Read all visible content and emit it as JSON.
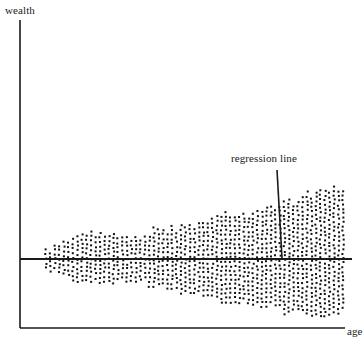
{
  "figure": {
    "background_color": "#ffffff",
    "ink_color": "#1a1a1a",
    "width": 364,
    "height": 345
  },
  "axes": {
    "y_axis_label": "wealth",
    "x_axis_label": "age",
    "y_axis_x": 20,
    "y_axis_top": 20,
    "y_axis_bottom": 328,
    "x_axis_y": 328,
    "x_axis_left": 20,
    "x_axis_right": 345,
    "zero_line_y": 259,
    "zero_line_left": 20,
    "zero_line_right": 352,
    "line_color": "#1a1a1a",
    "axis_line_width": 1.6,
    "zero_line_width": 1.8
  },
  "annotation": {
    "label": "regression line",
    "label_x": 231,
    "label_y": 152,
    "leader_x1": 277,
    "leader_y1": 170,
    "leader_x2": 282,
    "leader_y2": 258,
    "leader_width": 1.6,
    "color": "#1a1a1a"
  },
  "chart_data": {
    "type": "scatter",
    "title": "",
    "subtitle": "",
    "xlabel": "age",
    "ylabel": "wealth",
    "grid": false,
    "legend": null,
    "annotations": [
      {
        "text": "regression line",
        "describes": "horizontal line through the centre of the point cloud at wealth = 0 level",
        "points_to_x_px": 282,
        "points_to_y_px": 258
      }
    ],
    "xlim": [
      20,
      352
    ],
    "ylim": [
      328,
      20
    ],
    "regression_line": {
      "slope": 0,
      "intercept_px_y": 259,
      "x_start_px": 20,
      "x_end_px": 352
    },
    "cloud": {
      "x_start_px": 45,
      "x_end_px": 345,
      "center_y_px": 259,
      "dot_size_px": 2,
      "dot_pitch_px": 4.5,
      "jitter_px": 1.5,
      "approx_point_count": 2600,
      "envelope_note": "Half-height above and below the centre line, sampled left-to-right; irregular ragged boundary.",
      "upper_envelope": [
        {
          "x": 45,
          "half_height": 10
        },
        {
          "x": 60,
          "half_height": 17
        },
        {
          "x": 75,
          "half_height": 22
        },
        {
          "x": 90,
          "half_height": 25
        },
        {
          "x": 105,
          "half_height": 26
        },
        {
          "x": 120,
          "half_height": 24
        },
        {
          "x": 135,
          "half_height": 25
        },
        {
          "x": 150,
          "half_height": 28
        },
        {
          "x": 165,
          "half_height": 31
        },
        {
          "x": 180,
          "half_height": 33
        },
        {
          "x": 195,
          "half_height": 36
        },
        {
          "x": 210,
          "half_height": 40
        },
        {
          "x": 225,
          "half_height": 46
        },
        {
          "x": 240,
          "half_height": 44
        },
        {
          "x": 255,
          "half_height": 47
        },
        {
          "x": 270,
          "half_height": 54
        },
        {
          "x": 285,
          "half_height": 58
        },
        {
          "x": 300,
          "half_height": 62
        },
        {
          "x": 315,
          "half_height": 68
        },
        {
          "x": 330,
          "half_height": 72
        },
        {
          "x": 345,
          "half_height": 66
        }
      ],
      "lower_envelope": [
        {
          "x": 45,
          "half_height": 9
        },
        {
          "x": 60,
          "half_height": 16
        },
        {
          "x": 75,
          "half_height": 21
        },
        {
          "x": 90,
          "half_height": 24
        },
        {
          "x": 105,
          "half_height": 25
        },
        {
          "x": 120,
          "half_height": 22
        },
        {
          "x": 135,
          "half_height": 23
        },
        {
          "x": 150,
          "half_height": 26
        },
        {
          "x": 165,
          "half_height": 28
        },
        {
          "x": 180,
          "half_height": 31
        },
        {
          "x": 195,
          "half_height": 36
        },
        {
          "x": 210,
          "half_height": 40
        },
        {
          "x": 225,
          "half_height": 43
        },
        {
          "x": 240,
          "half_height": 45
        },
        {
          "x": 255,
          "half_height": 44
        },
        {
          "x": 270,
          "half_height": 48
        },
        {
          "x": 285,
          "half_height": 52
        },
        {
          "x": 300,
          "half_height": 55
        },
        {
          "x": 315,
          "half_height": 58
        },
        {
          "x": 330,
          "half_height": 56
        },
        {
          "x": 345,
          "half_height": 52
        }
      ]
    }
  }
}
